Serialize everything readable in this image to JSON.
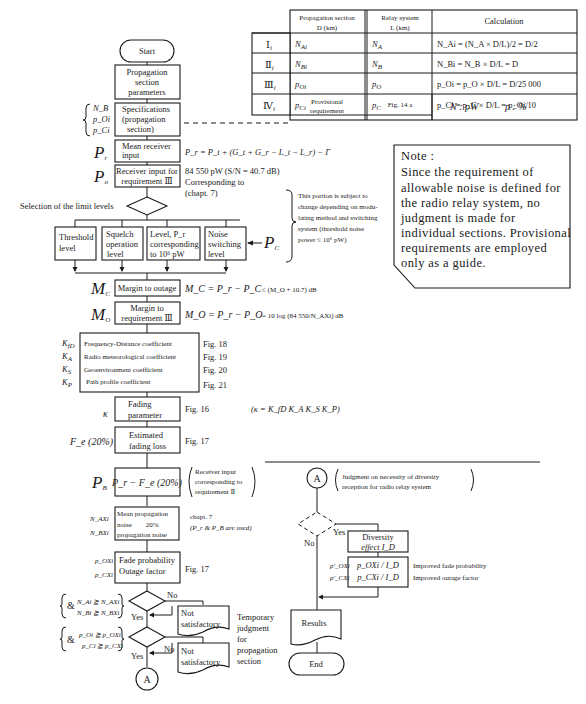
{
  "table": {
    "headers": {
      "section_l1": "Propagation section",
      "section_l2": "D (km)",
      "relay_l1": "Relay system",
      "relay_l2": "L (km)",
      "calc": "Calculation"
    },
    "rows": [
      {
        "id": "Ⅰ",
        "sub": "i",
        "section": "N",
        "section_sub": "Ai",
        "relay": "N",
        "relay_sub": "A",
        "calc": "N_Ai = (N_A × D/L)/2 = D/2"
      },
      {
        "id": "Ⅱ",
        "sub": "i",
        "section": "N",
        "section_sub": "Bi",
        "relay": "N",
        "relay_sub": "B",
        "calc": "N_Bi = N_B × D/L = D"
      },
      {
        "id": "Ⅲ",
        "sub": "i",
        "section": "p",
        "section_sub": "Oi",
        "relay": "p",
        "relay_sub": "O",
        "calc": "p_Oi = p_O × D/L = D/25 000"
      },
      {
        "id": "Ⅳ",
        "sub": "i",
        "section": "p",
        "section_sub": "Ci",
        "relay": "p",
        "relay_sub": "C",
        "calc": "p_Ci = p_C × D/L = p_Oi/10"
      }
    ],
    "footer": {
      "provisional_l1": "Provisional",
      "provisional_l2": "requirement",
      "fig": "Fig. 14 a",
      "units_n": "N : pW",
      "units_p": "p : %"
    }
  },
  "note": {
    "title": "Note :",
    "lines": [
      "Since the requirement of",
      "allowable noise is defined for",
      "the radio relay system, no",
      "judgment is made for",
      "individual sections. Provisional",
      "requirements are employed",
      "only as a guide."
    ]
  },
  "flow": {
    "start": "Start",
    "prop_params": [
      "Propagation",
      "section",
      "parameters"
    ],
    "spec": [
      "Specifications",
      "(propagation",
      "section)"
    ],
    "spec_vars": [
      "N_B",
      "p_Oi",
      "p_Ci"
    ],
    "pr_label": "P",
    "pr_sub": "r",
    "mean_rx": [
      "Mean receiver",
      "input"
    ],
    "pr_formula": "P_r = P_t + (G_t + G_r − L_t − L_r) − Γ",
    "po_label": "P",
    "po_sub": "o",
    "rx_req": [
      "Receiver input for",
      "requirement Ⅲ"
    ],
    "po_value": "84 550 pW (S/N = 40.7 dB)",
    "po_corr": [
      "Corresponding to",
      "(chapt. 7)"
    ],
    "selection": "Selection of the limit levels",
    "levels": [
      [
        "Threshold",
        "level"
      ],
      [
        "Squelch",
        "operation",
        "level"
      ],
      [
        "Level, P_r",
        "corresponding",
        "to 10⁶ pW"
      ],
      [
        "Noise",
        "switching",
        "level"
      ]
    ],
    "pc_label": "P",
    "pc_sub": "C",
    "subject_note": [
      "This portion is subject to",
      "change depending on modu-",
      "lating method and switching",
      "system (threshold noise",
      "power ≤ 10⁶ pW)"
    ],
    "mc_label": "M",
    "mc_sub": "C",
    "margin_outage": "Margin to outage",
    "mc_formula": "M_C = P_r − P_C",
    "mc_cond": "≤ (M_O + 10.7) dB",
    "mo_label": "M",
    "mo_sub": "O",
    "margin_req": [
      "Margin to",
      "requirement Ⅲ"
    ],
    "mo_formula": "M_O = P_r − P_O",
    "mo_cond": "= 10 log (84 550/N_AXi) dB",
    "coeffs": [
      {
        "sym": "K",
        "sub": "fD",
        "label": "Frequency-Distance coefficient",
        "fig": "Fig. 18"
      },
      {
        "sym": "K",
        "sub": "A",
        "label": "Radio meteorological coefficient",
        "fig": "Fig. 19"
      },
      {
        "sym": "K",
        "sub": "S",
        "label": "Geoenvironment coefficient",
        "fig": "Fig. 20"
      },
      {
        "sym": "K",
        "sub": "P",
        "label": "Path profile coefficient",
        "fig": "Fig. 21"
      }
    ],
    "kappa": "κ",
    "fading_param": [
      "Fading",
      "parameter"
    ],
    "fading_fig": "Fig. 16",
    "kappa_formula": "(κ = K_fD K_A K_S K_P)",
    "fe_label": "F_e (20%)",
    "est_fading": [
      "Estimated",
      "fading loss"
    ],
    "fe_fig": "Fig. 17",
    "pb_label": "P",
    "pb_sub": "B",
    "pb_box": "P_r − F_e (20%)",
    "pb_note": [
      "Receiver input",
      "corresponding to",
      "requirement Ⅱ"
    ],
    "noise_vars": [
      "N_AXi",
      "N_BXi"
    ],
    "noise_box": [
      "Mean propagation",
      "noise        20%",
      "propagation noise"
    ],
    "noise_note": [
      "chapt. 7",
      "(P_r & P_B are used)"
    ],
    "fade_vars": [
      "p_OXi",
      "p_CXi"
    ],
    "fade_box": [
      "Fade probability",
      "Outage factor"
    ],
    "fade_fig": "Fig. 17",
    "cond1": [
      "N_Ai ≧ N_AXi",
      "N_Bi ≧ N_BXi"
    ],
    "cond2": [
      "p_Oi ≧ p_OXi",
      "p_Ci ≧ p_CXi"
    ],
    "amp": "&",
    "yes": "Yes",
    "no": "No",
    "not_satisfactory": [
      "Not",
      "satisfactory"
    ],
    "temp_judgment": [
      "Temporary",
      "judgment",
      "for",
      "propagation",
      "section"
    ],
    "connector": "A"
  },
  "diversity": {
    "connector": "A",
    "note": [
      "Judgment on necessity of diversity",
      "reception for radio relay system"
    ],
    "yes": "Yes",
    "no": "No",
    "effect": [
      "Diversity",
      "effect I_D"
    ],
    "vars": [
      "p′_OXi",
      "p′_CXi"
    ],
    "formulas": [
      "p_OXi / I_D",
      "p_CXi / I_D"
    ],
    "improved": [
      "Improved fade probability",
      "Improved outage factor"
    ],
    "results": "Results",
    "end": "End"
  }
}
